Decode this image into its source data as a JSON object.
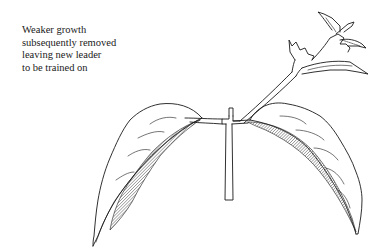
{
  "diagram": {
    "annotation": {
      "lines": [
        "Weaker growth",
        "subsequently removed",
        "leaving new leader",
        "to be trained on"
      ]
    },
    "colors": {
      "ink": "#1a1a1a",
      "background": "#ffffff",
      "hatch": "#555555"
    }
  }
}
